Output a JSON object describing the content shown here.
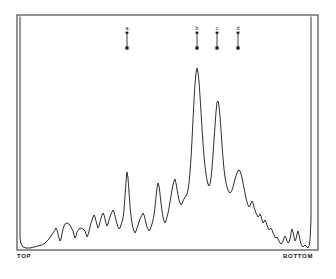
{
  "figure": {
    "kind": "densitometer-trace",
    "background_color": "#ffffff",
    "trace_color": "#1a1a1a",
    "frame_color": "#3b3b3b"
  },
  "axis_labels": {
    "left": "TOP",
    "right": "BOTTOM"
  },
  "markers": [
    {
      "label": "a",
      "x": 127,
      "shaft_top": 33,
      "shaft_bottom": 48
    },
    {
      "label": "b",
      "x": 197,
      "shaft_top": 33,
      "shaft_bottom": 48
    },
    {
      "label": "c",
      "x": 217,
      "shaft_top": 33,
      "shaft_bottom": 48
    },
    {
      "label": "d",
      "x": 238,
      "shaft_top": 33,
      "shaft_bottom": 48
    }
  ],
  "chart_data": {
    "type": "line",
    "title": "",
    "subtitle": "",
    "xlabel": "",
    "ylabel": "",
    "grid": false,
    "legend": "none",
    "axis_tick_labels": {
      "x": [
        "TOP",
        "BOTTOM"
      ],
      "y": []
    },
    "xlim": [
      17,
      318
    ],
    "ylim": [
      15,
      250
    ],
    "annotations": [
      {
        "text": "a",
        "x": 127,
        "y": 33,
        "type": "down-arrow"
      },
      {
        "text": "b",
        "x": 197,
        "y": 33,
        "type": "down-arrow"
      },
      {
        "text": "c",
        "x": 217,
        "y": 33,
        "type": "down-arrow"
      },
      {
        "text": "d",
        "x": 238,
        "y": 33,
        "type": "down-arrow"
      }
    ],
    "frame": {
      "x": 17,
      "y": 15,
      "width": 301,
      "height": 235
    },
    "series": [
      {
        "name": "absorbance-trace",
        "points": "20,17 20,238 21,244 23,247 26,248 30,248 34,247 38,246 42,245 45,243 47,241 49,239 51,236 53,233 55,230 56,228 57,230 58,234 59,238 60,241 61,239 62,234 63,229 64,226 65,224 67,223 69,224 71,227 73,231 74,235 75,238 76,236 77,232 79,229 81,228 83,229 85,231 86,234 87,237 88,235 89,231 90,227 91,223 92,220 93,217 94,215 95,217 96,221 97,225 98,228 99,226 100,222 101,218 102,215 103,213 104,215 105,219 106,223 107,226 108,224 109,220 110,217 111,214 112,212 113,210 114,212 115,216 116,220 117,224 118,227 119,229 120,228 121,225 122,222 123,218 124,210 125,196 126,182 127,172 128,178 129,192 130,206 131,216 132,223 133,228 134,231 135,233 136,231 137,228 138,225 139,222 140,219 141,217 142,215 143,213 144,215 145,219 146,223 147,227 148,229 149,231 150,230 151,227 152,224 153,220 154,215 155,207 156,197 157,188 158,183 159,186 160,194 161,203 162,211 163,217 164,221 165,223 166,221 167,217 168,213 169,208 170,202 171,196 172,190 173,185 174,181 175,179 176,183 177,189 178,195 179,200 180,203 181,205 182,204 183,201 184,199 185,197 186,196 187,194 188,190 189,183 190,172 191,158 192,140 193,120 194,100 195,84 196,73 197,68 198,72 199,82 200,96 201,112 202,128 203,143 204,156 205,166 206,174 207,180 208,184 209,186 210,184 211,178 212,168 213,155 214,140 215,126 216,112 217,102 218,101 219,106 220,116 221,130 222,145 223,158 224,169 225,177 226,183 227,187 228,190 229,192 230,193 231,192 232,190 233,187 234,183 235,179 236,176 237,173 238,171 239,170 240,171 241,174 242,178 243,183 244,188 245,193 246,198 247,202 248,205 249,207 250,206 251,203 252,201 253,203 254,207 255,210 256,213 257,215 258,217 259,216 260,214 261,216 262,220 263,223 264,222 265,220 266,222 267,225 268,228 269,230 270,229 271,228 272,230 273,233 274,235 275,237 276,238 277,237 278,239 279,241 280,243 281,244 282,243 283,241 284,238 285,236 286,238 287,241 288,243 289,242 290,239 291,233 292,229 293,232 294,237 295,241 296,239 297,234 298,231 299,235 300,240 301,244 302,246 303,247 304,246 305,245 306,246 307,247 308,248 309,246 310,240 311,220 311,17"
      }
    ]
  }
}
